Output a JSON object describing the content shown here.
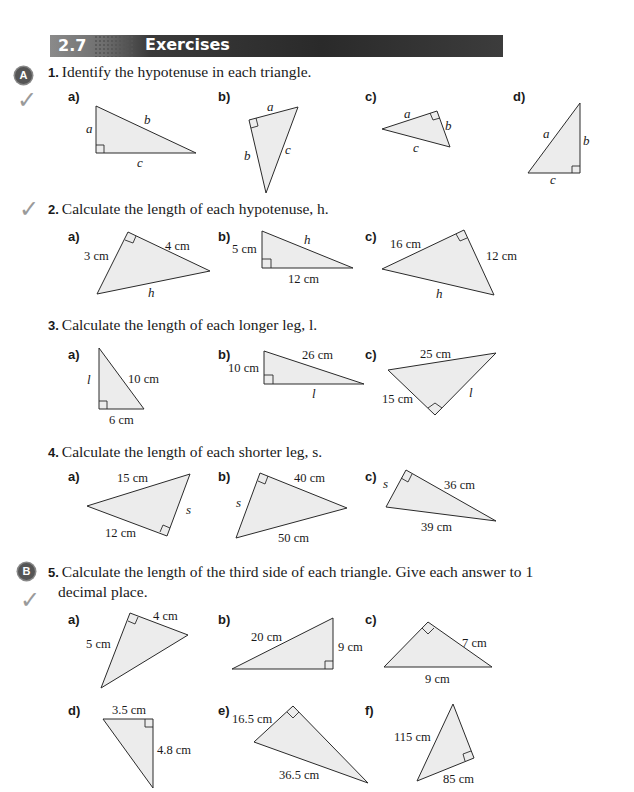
{
  "header": {
    "section_number": "2.7",
    "title": "Exercises"
  },
  "badges": {
    "a": "A",
    "b": "B"
  },
  "questions": [
    {
      "number": "1.",
      "text": "Identify the hypotenuse in each triangle.",
      "parts": [
        {
          "label": "a)",
          "sides": [
            "a",
            "b",
            "c"
          ]
        },
        {
          "label": "b)",
          "sides": [
            "a",
            "b",
            "c"
          ]
        },
        {
          "label": "c)",
          "sides": [
            "a",
            "b",
            "c"
          ]
        },
        {
          "label": "d)",
          "sides": [
            "a",
            "b",
            "c"
          ]
        }
      ]
    },
    {
      "number": "2.",
      "text": "Calculate the length of each hypotenuse, h.",
      "parts": [
        {
          "label": "a)",
          "sides": [
            "3 cm",
            "4 cm",
            "h"
          ]
        },
        {
          "label": "b)",
          "sides": [
            "5 cm",
            "h",
            "12 cm"
          ]
        },
        {
          "label": "c)",
          "sides": [
            "16 cm",
            "12 cm",
            "h"
          ]
        }
      ]
    },
    {
      "number": "3.",
      "text": "Calculate the length of each longer leg, l.",
      "parts": [
        {
          "label": "a)",
          "sides": [
            "l",
            "10 cm",
            "6 cm"
          ]
        },
        {
          "label": "b)",
          "sides": [
            "10 cm",
            "26 cm",
            "l"
          ]
        },
        {
          "label": "c)",
          "sides": [
            "25 cm",
            "15 cm",
            "l"
          ]
        }
      ]
    },
    {
      "number": "4.",
      "text": "Calculate the length of each shorter leg, s.",
      "parts": [
        {
          "label": "a)",
          "sides": [
            "15 cm",
            "s",
            "12 cm"
          ]
        },
        {
          "label": "b)",
          "sides": [
            "40 cm",
            "s",
            "50 cm"
          ]
        },
        {
          "label": "c)",
          "sides": [
            "s",
            "36 cm",
            "39 cm"
          ]
        }
      ]
    },
    {
      "number": "5.",
      "text": "Calculate the length of the third side of each triangle. Give each answer to 1",
      "text_line2": "decimal place.",
      "parts": [
        {
          "label": "a)",
          "sides": [
            "4 cm",
            "5 cm"
          ]
        },
        {
          "label": "b)",
          "sides": [
            "20 cm",
            "9 cm"
          ]
        },
        {
          "label": "c)",
          "sides": [
            "7 cm",
            "9 cm"
          ]
        },
        {
          "label": "d)",
          "sides": [
            "3.5 cm",
            "4.8 cm"
          ]
        },
        {
          "label": "e)",
          "sides": [
            "16.5 cm",
            "36.5 cm"
          ]
        },
        {
          "label": "f)",
          "sides": [
            "115 cm",
            "85 cm"
          ]
        }
      ]
    }
  ],
  "icons": {
    "check": "✓"
  }
}
